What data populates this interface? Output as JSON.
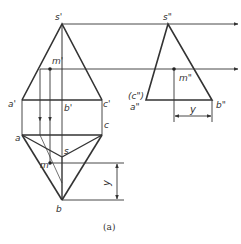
{
  "figure": {
    "caption": "(a)",
    "colors": {
      "line": "#333333",
      "background": "#ffffff"
    }
  },
  "front_view": {
    "labels": {
      "s": "s'",
      "m": "m'",
      "a": "a'",
      "b": "b'",
      "c": "c'"
    }
  },
  "side_view": {
    "labels": {
      "s": "s\"",
      "m": "m\"",
      "c": "(c\")",
      "a": "a\"",
      "b": "b\""
    },
    "dimension_label": "y"
  },
  "top_view": {
    "labels": {
      "a": "a",
      "c": "c",
      "s": "s",
      "m": "m",
      "b": "b"
    },
    "dimension_label": "y"
  }
}
